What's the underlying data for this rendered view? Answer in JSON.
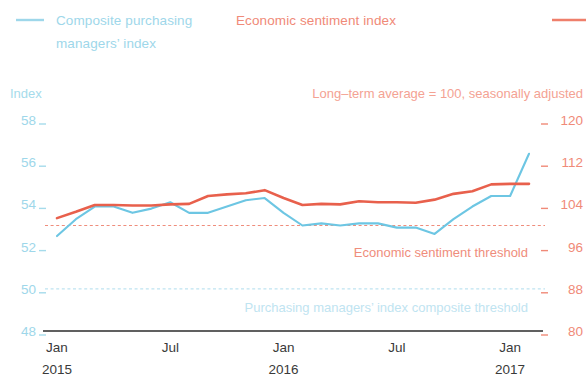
{
  "legend": {
    "left": {
      "label": "Composite purchasing managers’ index",
      "line1": "Composite purchasing",
      "line2": "managers’ index",
      "color": "#6dc6e3",
      "swatch": "line-swatch"
    },
    "right": {
      "label": "Economic sentiment index",
      "color": "#e8604c",
      "swatch": "line-swatch"
    }
  },
  "subtitle": "Long–term average = 100, seasonally adjusted",
  "annotations": {
    "red_threshold": "Economic sentiment threshold",
    "blue_threshold": "Purchasing managers’ index composite threshold"
  },
  "chart_data": {
    "type": "line",
    "title": "",
    "subtitle": "Long–term average = 100, seasonally adjusted",
    "xlabel": "",
    "ylabel": "Index",
    "grid": false,
    "legend_position": "top",
    "x": [
      "Jan 2015",
      "Feb 2015",
      "Mar 2015",
      "Apr 2015",
      "May 2015",
      "Jun 2015",
      "Jul 2015",
      "Aug 2015",
      "Sep 2015",
      "Oct 2015",
      "Nov 2015",
      "Dec 2015",
      "Jan 2016",
      "Feb 2016",
      "Mar 2016",
      "Apr 2016",
      "May 2016",
      "Jun 2016",
      "Jul 2016",
      "Aug 2016",
      "Sep 2016",
      "Oct 2016",
      "Nov 2016",
      "Dec 2016",
      "Jan 2017",
      "Feb 2017"
    ],
    "xticks": [
      "Jan 2015",
      "Jul",
      "Jan 2016",
      "Jul",
      "Jan 2017"
    ],
    "xtick_lines": [
      [
        "Jan",
        "2015"
      ],
      [
        "Jul",
        ""
      ],
      [
        "Jan",
        "2016"
      ],
      [
        "Jul",
        ""
      ],
      [
        "Jan",
        "2017"
      ]
    ],
    "axis_left": {
      "label": "Index",
      "ticks": [
        58,
        56,
        54,
        52,
        50,
        48
      ],
      "ylim": [
        48,
        58
      ],
      "color": "#9ed7ea"
    },
    "axis_right": {
      "label": "",
      "ticks": [
        120,
        112,
        104,
        96,
        88,
        80
      ],
      "ylim": [
        80,
        120
      ],
      "color": "#f08a78"
    },
    "series": [
      {
        "name": "Composite purchasing managers’ index",
        "axis": "left",
        "color": "#6dc6e3",
        "values": [
          52.5,
          53.3,
          53.9,
          53.9,
          53.6,
          53.8,
          54.1,
          53.6,
          53.6,
          53.9,
          54.2,
          54.3,
          53.6,
          53.0,
          53.1,
          53.0,
          53.1,
          53.1,
          52.9,
          52.9,
          52.6,
          53.3,
          53.9,
          54.4,
          54.4,
          56.4
        ]
      },
      {
        "name": "Economic sentiment index",
        "axis": "right",
        "color": "#e8604c",
        "values": [
          101.4,
          102.6,
          103.9,
          103.9,
          103.8,
          103.8,
          104.0,
          104.1,
          105.6,
          105.9,
          106.1,
          106.7,
          105.2,
          103.9,
          104.1,
          104.0,
          104.6,
          104.4,
          104.4,
          104.3,
          104.9,
          106.0,
          106.5,
          107.8,
          107.9,
          107.9
        ]
      }
    ],
    "reference_lines": [
      {
        "name": "Economic sentiment threshold",
        "axis": "right",
        "value": 100,
        "color": "#ef8d7c",
        "style": "dashed"
      },
      {
        "name": "Purchasing managers’ index composite threshold",
        "axis": "left",
        "value": 50,
        "color": "#bfe4f1",
        "style": "dashed"
      }
    ]
  }
}
